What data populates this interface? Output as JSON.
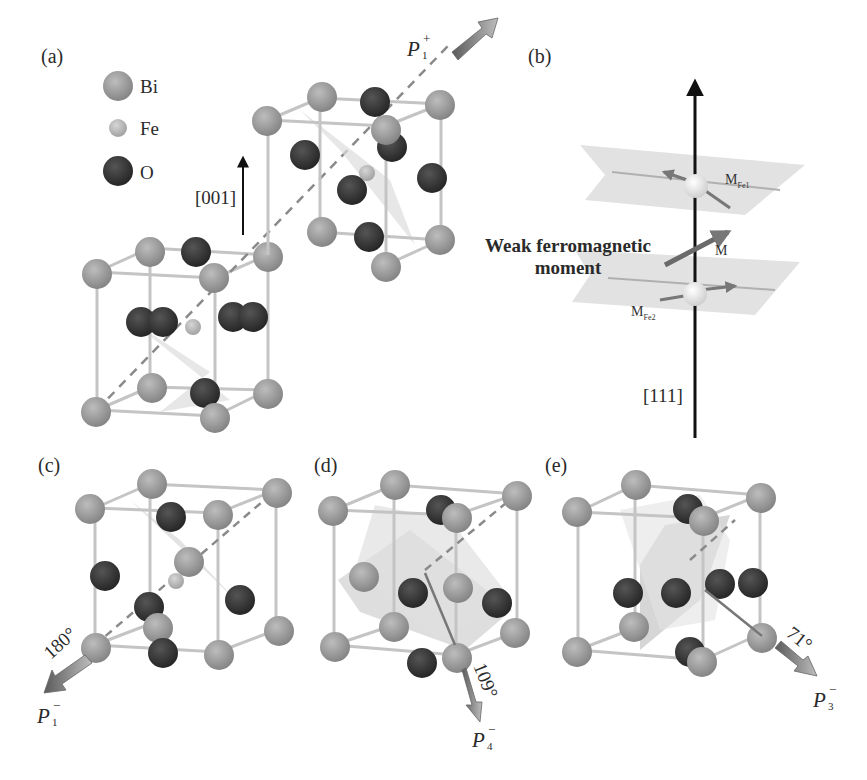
{
  "figure": {
    "panels": {
      "a": {
        "label": "(a)",
        "direction": "[001]",
        "polarization": {
          "base": "P",
          "sub": "1",
          "sup": "+"
        }
      },
      "b": {
        "label": "(b)",
        "axis": "[111]",
        "annotation": "Weak ferromagnetic moment",
        "annotation_line1": "Weak ferromagnetic",
        "annotation_line2": "moment",
        "m_fe1": {
          "base": "M",
          "sub": "Fe1"
        },
        "m_fe2": {
          "base": "M",
          "sub": "Fe2"
        },
        "m_total": "M"
      },
      "c": {
        "label": "(c)",
        "angle": "180°",
        "polarization": {
          "base": "P",
          "sub": "1",
          "sup": "−"
        }
      },
      "d": {
        "label": "(d)",
        "angle": "109°",
        "polarization": {
          "base": "P",
          "sub": "4",
          "sup": "−"
        }
      },
      "e": {
        "label": "(e)",
        "angle": "71°",
        "polarization": {
          "base": "P",
          "sub": "3",
          "sup": "−"
        }
      }
    },
    "legend": [
      {
        "element": "Bi",
        "color": "#9a9a9a",
        "size": "large"
      },
      {
        "element": "Fe",
        "color": "#b4b4b4",
        "size": "small"
      },
      {
        "element": "O",
        "color": "#3a3a3a",
        "size": "large"
      }
    ],
    "colors": {
      "bi": "#9b9b9b",
      "fe": "#bdbdbd",
      "o": "#3b3b3b",
      "bond": "#c8c8c8",
      "plane": "#d9d9d9",
      "arrow": "#6f6f6f",
      "axis": "#111111"
    }
  }
}
